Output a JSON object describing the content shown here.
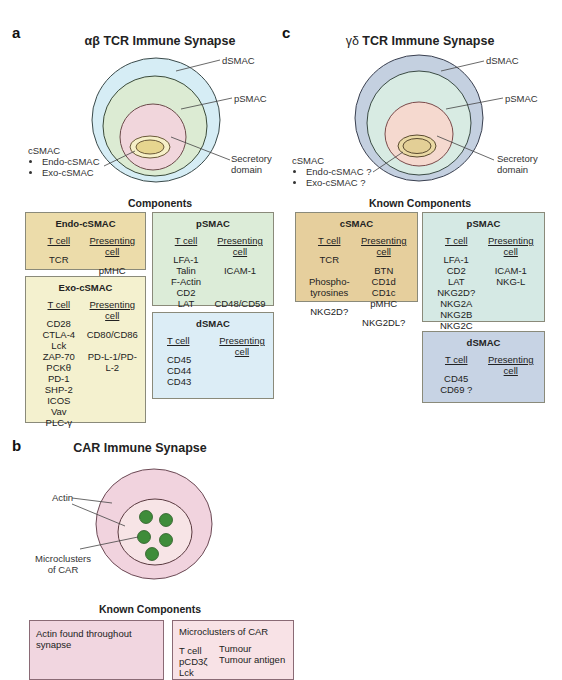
{
  "panel_a": {
    "letter": "a",
    "title": "αβ TCR Immune Synapse",
    "labels": {
      "dsmac": "dSMAC",
      "psmac": "pSMAC",
      "csmac": "cSMAC",
      "csmac_items": [
        "Endo-cSMAC",
        "Exo-cSMAC"
      ],
      "secretory": "Secretory domain"
    },
    "components_title": "Components",
    "boxes": {
      "endo": {
        "title": "Endo-cSMAC",
        "col1_header": "T cell",
        "col2_header": "Presenting cell",
        "col1": [
          "TCR"
        ],
        "col2": [
          "pMHC"
        ]
      },
      "exo": {
        "title": "Exo-cSMAC",
        "col1_header": "T cell",
        "col2_header": "Presenting cell",
        "col1": [
          "CD28",
          "CTLA-4",
          "Lck",
          "ZAP-70",
          "PCKθ",
          "PD-1",
          "SHP-2",
          "ICOS",
          "Vav",
          "PLC-γ"
        ],
        "col2": [
          "CD80/CD86",
          "",
          "PD-L-1/PD-L-2"
        ]
      },
      "psmac": {
        "title": "pSMAC",
        "col1_header": "T cell",
        "col2_header": "Presenting cell",
        "col1": [
          "LFA-1",
          "Talin",
          "F-Actin",
          "CD2",
          "LAT"
        ],
        "col2": [
          "ICAM-1",
          "",
          "",
          "CD48/CD59"
        ]
      },
      "dsmac": {
        "title": "dSMAC",
        "col1_header": "T cell",
        "col2_header": "Presenting cell",
        "col1": [
          "CD45",
          "CD44",
          "CD43"
        ],
        "col2": []
      }
    },
    "colors": {
      "dsmac": "#d6edf5",
      "psmac": "#dcebd3",
      "center": "#f1d6dc",
      "csmac": "#e6d58f",
      "endo_box": "#ecdcaa",
      "exo_box": "#f4f1cf",
      "psmac_box": "#dcecd8",
      "dsmac_box": "#dcedf6"
    }
  },
  "panel_c": {
    "letter": "c",
    "title_greek": "γδ",
    "title": "TCR Immune Synapse",
    "labels": {
      "dsmac": "dSMAC",
      "psmac": "pSMAC",
      "csmac": "cSMAC",
      "csmac_items": [
        "Endo-cSMAC ?",
        "Exo-cSMAC ?"
      ],
      "secretory": "Secretory domain"
    },
    "components_title": "Known Components",
    "boxes": {
      "csmac": {
        "title": "cSMAC",
        "col1_header": "T cell",
        "col2_header": "Presenting cell",
        "col1": [
          "TCR",
          "",
          "Phospho-",
          "tyrosines",
          "",
          "NKG2D?"
        ],
        "col2": [
          "BTN",
          "CD1d",
          "CD1c",
          "pMHC",
          "",
          "NKG2DL?"
        ]
      },
      "psmac": {
        "title": "pSMAC",
        "col1_header": "T cell",
        "col2_header": "Presenting cell",
        "col1": [
          "LFA-1",
          "CD2",
          "LAT",
          "NKG2D?",
          "NKG2A",
          "NKG2B",
          "NKG2C"
        ],
        "col2": [
          "ICAM-1",
          "NKG-L"
        ]
      },
      "dsmac": {
        "title": "dSMAC",
        "col1_header": "T cell",
        "col2_header": "Presenting cell",
        "col1": [
          "CD45",
          "CD69 ?"
        ],
        "col2": []
      }
    },
    "colors": {
      "dsmac": "#c4d0e0",
      "psmac": "#d8ebe3",
      "center": "#f5d9cf",
      "csmac": "#e3cf96",
      "csmac_box": "#e6cf9d",
      "psmac_box": "#d5e9e4",
      "dsmac_box": "#c7d3e4"
    }
  },
  "panel_b": {
    "letter": "b",
    "title": "CAR Immune Synapse",
    "labels": {
      "actin": "Actin",
      "microclusters": "Microclusters of CAR"
    },
    "components_title": "Known Components",
    "boxes": {
      "actin": {
        "text": "Actin found throughout synapse"
      },
      "micro": {
        "title": "Microclusters of CAR",
        "col1": [
          "T cell",
          "pCD3ζ",
          "Lck"
        ],
        "col2": [
          "Tumour",
          "Tumour antigen"
        ]
      }
    },
    "colors": {
      "outer": "#f1d3de",
      "inner": "#f7e4e6",
      "cluster": "#3f8c3a",
      "actin_box": "#f1d6e0",
      "micro_box": "#f8e2e6"
    }
  }
}
